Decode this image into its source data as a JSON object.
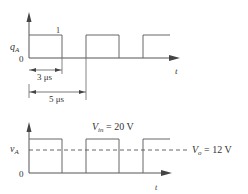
{
  "top_plot": {
    "y_label": "q",
    "y_label_sub": "A",
    "origin_label": "0",
    "high_label": "1",
    "x_axis_label": "t",
    "dim_on_time": "3 μs",
    "dim_period": "5 μs"
  },
  "bottom_plot": {
    "y_label": "v",
    "y_label_sub": "A",
    "origin_label": "0",
    "x_axis_label": "t",
    "vin_label_main": "V",
    "vin_label_sub": "in",
    "vin_label_value": " = 20 V",
    "vo_label_main": "V",
    "vo_label_sub": "o",
    "vo_label_value": " = 12 V"
  },
  "colors": {
    "line": "#555555",
    "text": "#333333"
  }
}
